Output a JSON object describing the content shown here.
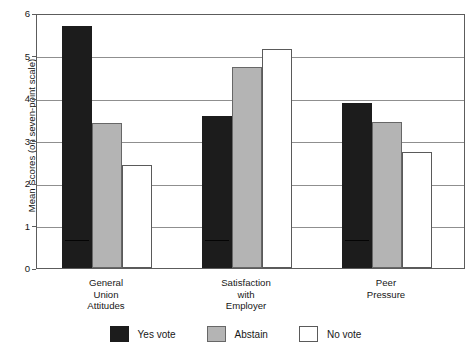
{
  "chart_data": {
    "type": "bar",
    "title": "",
    "xlabel": "",
    "ylabel": "Mean Scores (on seven-point scale)",
    "ylim": [
      0,
      6
    ],
    "yticks": [
      "0",
      "1",
      "2",
      "3",
      "4",
      "5",
      "6"
    ],
    "grid": true,
    "legend_position": "bottom",
    "categories": [
      "General\nUnion\nAttitudes",
      "Satisfaction\nwith\nEmployer",
      "Peer\nPressure"
    ],
    "series": [
      {
        "name": "Yes vote",
        "color": "#1c1c1c",
        "values": [
          5.7,
          3.58,
          3.89
        ]
      },
      {
        "name": "Abstain",
        "color": "#b4b4b4",
        "values": [
          3.41,
          4.72,
          3.43
        ]
      },
      {
        "name": "No vote",
        "color": "#ffffff",
        "values": [
          2.43,
          5.16,
          2.74
        ]
      }
    ]
  },
  "axis": {
    "y_title": "Mean Scores (on seven-point scale)",
    "y_ticks": [
      "6",
      "5",
      "4",
      "3",
      "2",
      "1",
      "0"
    ]
  },
  "categories": {
    "c0": "General\nUnion\nAttitudes",
    "c1": "Satisfaction\nwith\nEmployer",
    "c2": "Peer\nPressure"
  },
  "legend": {
    "yes_label": "Yes vote",
    "abstain_label": "Abstain",
    "no_label": "No vote"
  }
}
